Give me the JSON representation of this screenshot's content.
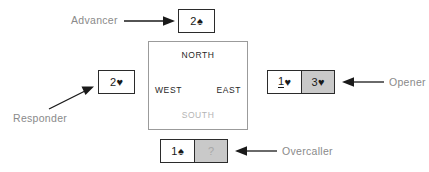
{
  "diagram": {
    "colors": {
      "label_gray": "#8a8a8a",
      "box_border": "#2b2b2b",
      "cell_gray": "#c9c9c9",
      "compass_border": "#9b9b9b",
      "south_gray": "#b4b4b4",
      "arrow": "#1a1a1a"
    }
  },
  "compass": {
    "north": "NORTH",
    "west": "WEST",
    "east": "EAST",
    "south": "SOUTH"
  },
  "positions": {
    "advancer": {
      "label": "Advancer",
      "bids": [
        {
          "level": "2",
          "suit": "♠",
          "suit_name": "spade",
          "fill": "white",
          "underlined": false
        }
      ]
    },
    "responder": {
      "label": "Responder",
      "bids": [
        {
          "level": "2",
          "suit": "♥",
          "suit_name": "heart",
          "fill": "white",
          "underlined": false
        }
      ]
    },
    "opener": {
      "label": "Opener",
      "bids": [
        {
          "level": "1",
          "suit": "♥",
          "suit_name": "heart",
          "fill": "white",
          "underlined": true
        },
        {
          "level": "3",
          "suit": "♥",
          "suit_name": "heart",
          "fill": "gray",
          "underlined": false
        }
      ]
    },
    "overcaller": {
      "label": "Overcaller",
      "bids": [
        {
          "level": "1",
          "suit": "♠",
          "suit_name": "spade",
          "fill": "white",
          "underlined": false
        },
        {
          "level": "?",
          "suit": "",
          "suit_name": "question",
          "fill": "gray",
          "underlined": false
        }
      ]
    }
  }
}
